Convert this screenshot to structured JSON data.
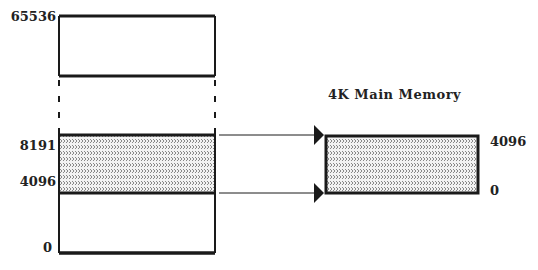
{
  "diagram": {
    "type": "memory-mapping",
    "address_space": {
      "labels": {
        "top": "65536",
        "mapped_high": "8191",
        "mapped_low": "4096",
        "bottom": "0"
      }
    },
    "main_memory": {
      "title": "4K Main Memory",
      "labels": {
        "top": "4096",
        "bottom": "0"
      }
    },
    "colors": {
      "line": "#1a1a1a",
      "hatch": "#8a8a8a",
      "background": "#ffffff"
    }
  }
}
